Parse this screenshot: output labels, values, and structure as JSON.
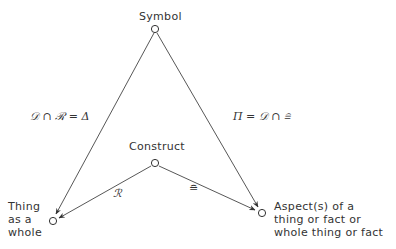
{
  "nodes": {
    "symbol": {
      "label": "Symbol"
    },
    "construct": {
      "label": "Construct"
    },
    "thing": {
      "label": "Thing\nas a\nwhole"
    },
    "aspect": {
      "label": "Aspect(s) of a\nthing or fact or\nwhole thing or fact"
    }
  },
  "edges": {
    "symbol_to_thing": {
      "label": "𝒟 ∩ ℛ = Δ"
    },
    "symbol_to_aspect": {
      "label": "Π = 𝒟 ∩ ≘"
    },
    "construct_to_thing": {
      "label": "ℛ"
    },
    "construct_to_aspect": {
      "label": "≘"
    }
  },
  "colors": {
    "line": "#444444",
    "background": "#ffffff"
  }
}
